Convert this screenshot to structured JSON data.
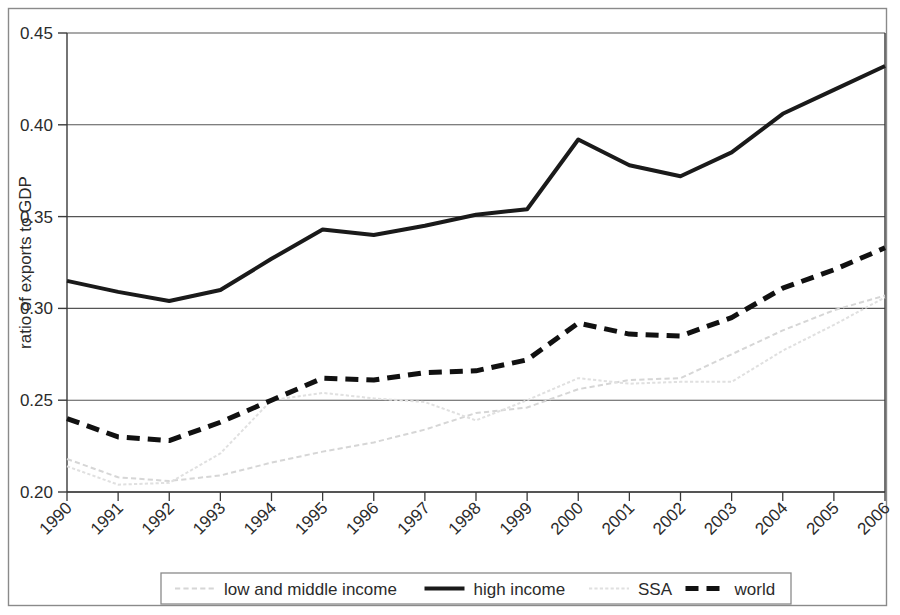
{
  "chart_data": {
    "type": "line",
    "title": "",
    "subtitle": "",
    "xlabel": "",
    "ylabel": "ratio of exports to GDP",
    "x": [
      1990,
      1991,
      1992,
      1993,
      1994,
      1995,
      1996,
      1997,
      1998,
      1999,
      2000,
      2001,
      2002,
      2003,
      2004,
      2005,
      2006
    ],
    "categories": [
      "1990",
      "1991",
      "1992",
      "1993",
      "1994",
      "1995",
      "1996",
      "1997",
      "1998",
      "1999",
      "2000",
      "2001",
      "2002",
      "2003",
      "2004",
      "2005",
      "2006"
    ],
    "xlim": [
      1990,
      2006
    ],
    "ylim": [
      0.2,
      0.45
    ],
    "yticks": [
      0.2,
      0.25,
      0.3,
      0.35,
      0.4,
      0.45
    ],
    "ytick_labels": [
      "0.20",
      "0.25",
      "0.30",
      "0.35",
      "0.40",
      "0.45"
    ],
    "grid": "horizontal",
    "legend_position": "bottom",
    "series": [
      {
        "name": "low and middle income",
        "style": "dashed",
        "color": "#d6d6d6",
        "width": 2,
        "values": [
          0.218,
          0.208,
          0.206,
          0.209,
          0.216,
          0.222,
          0.227,
          0.234,
          0.243,
          0.246,
          0.256,
          0.261,
          0.262,
          0.275,
          0.288,
          0.299,
          0.307
        ]
      },
      {
        "name": "high income",
        "style": "solid",
        "color": "#1a1a1a",
        "width": 4,
        "values": [
          0.315,
          0.309,
          0.304,
          0.31,
          0.327,
          0.343,
          0.34,
          0.345,
          0.351,
          0.354,
          0.392,
          0.378,
          0.372,
          0.385,
          0.406,
          0.419,
          0.432
        ]
      },
      {
        "name": "SSA",
        "style": "dotted",
        "color": "#e0e0e0",
        "width": 2,
        "values": [
          0.214,
          0.204,
          0.205,
          0.221,
          0.25,
          0.254,
          0.251,
          0.249,
          0.239,
          0.25,
          0.262,
          0.259,
          0.26,
          0.26,
          0.277,
          0.291,
          0.306
        ]
      },
      {
        "name": "world",
        "style": "dashed",
        "color": "#111111",
        "width": 5,
        "values": [
          0.24,
          0.23,
          0.228,
          0.238,
          0.25,
          0.262,
          0.261,
          0.265,
          0.266,
          0.272,
          0.292,
          0.286,
          0.285,
          0.295,
          0.311,
          0.321,
          0.333
        ]
      }
    ]
  },
  "legend": {
    "items": [
      {
        "label": "low and middle income",
        "swatch": "dashed-light-line-icon"
      },
      {
        "label": "high income",
        "swatch": "solid-black-line-icon"
      },
      {
        "label": "SSA",
        "swatch": "dotted-light-line-icon"
      },
      {
        "label": "world",
        "swatch": "dashed-black-line-icon"
      }
    ]
  },
  "colors": {
    "axis": "#3a3a3a",
    "grid": "#555555",
    "frame": "#888888",
    "text": "#2b2b2b",
    "light_series": "#dcdcdc",
    "dark_series": "#111111"
  }
}
